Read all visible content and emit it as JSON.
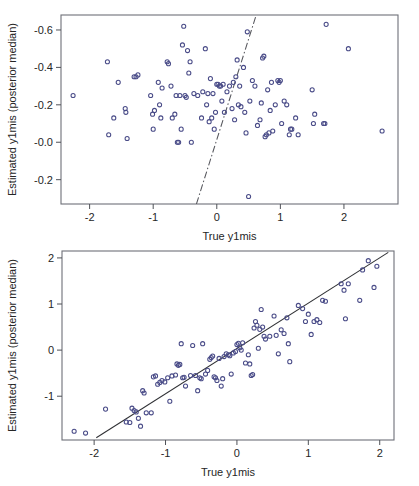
{
  "figure": {
    "panel_count": 2,
    "marker_color": "#4a4c88",
    "line_color": "#2f3034",
    "frame_color": "#6e7078",
    "background_color": "#ffffff"
  },
  "chart_data": [
    {
      "panel": "top",
      "type": "scatter",
      "title": "",
      "xlabel": "True y1mis",
      "ylabel": "Estimated y1mis (posterior median)",
      "xticks": [
        "-2",
        "-1",
        "0",
        "1",
        "2"
      ],
      "xtick_values": [
        -2,
        -1,
        0,
        1,
        2
      ],
      "yticks": [
        "-0.6",
        "-0.4",
        "-0.2",
        "-0.0",
        "-0.2"
      ],
      "ytick_values": [
        0.6,
        0.4,
        0.2,
        0.0,
        -0.2
      ],
      "xlim": [
        -2.45,
        2.85
      ],
      "ylim": [
        -0.33,
        0.68
      ],
      "grid": false,
      "legend": "none",
      "annotations": [
        "dash-dot reference line with steep positive slope"
      ],
      "reference_line": {
        "style": "dashdot",
        "x_from": -0.32,
        "y_from": -0.33,
        "x_to": 0.62,
        "y_to": 0.68
      },
      "points": [
        [
          -2.26,
          0.25
        ],
        [
          -1.72,
          0.43
        ],
        [
          -1.7,
          0.04
        ],
        [
          -1.62,
          0.13
        ],
        [
          -1.55,
          0.32
        ],
        [
          -1.44,
          0.18
        ],
        [
          -1.43,
          0.16
        ],
        [
          -1.41,
          0.02
        ],
        [
          -1.3,
          0.35
        ],
        [
          -1.27,
          0.35
        ],
        [
          -1.24,
          0.36
        ],
        [
          -1.04,
          0.25
        ],
        [
          -1.01,
          0.15
        ],
        [
          -1.0,
          0.07
        ],
        [
          -0.98,
          0.17
        ],
        [
          -0.92,
          0.32
        ],
        [
          -0.9,
          0.2
        ],
        [
          -0.88,
          0.13
        ],
        [
          -0.86,
          0.29
        ],
        [
          -0.78,
          0.43
        ],
        [
          -0.76,
          0.42
        ],
        [
          -0.72,
          0.3
        ],
        [
          -0.7,
          0.13
        ],
        [
          -0.66,
          0.15
        ],
        [
          -0.64,
          0.25
        ],
        [
          -0.62,
          0.0
        ],
        [
          -0.6,
          0.0
        ],
        [
          -0.58,
          0.25
        ],
        [
          -0.56,
          0.07
        ],
        [
          -0.54,
          0.52
        ],
        [
          -0.52,
          0.62
        ],
        [
          -0.5,
          0.25
        ],
        [
          -0.48,
          0.24
        ],
        [
          -0.46,
          0.49
        ],
        [
          -0.44,
          0.37
        ],
        [
          -0.42,
          0.43
        ],
        [
          -0.4,
          0.0
        ],
        [
          -0.36,
          0.26
        ],
        [
          -0.3,
          0.25
        ],
        [
          -0.24,
          0.13
        ],
        [
          -0.22,
          0.27
        ],
        [
          -0.18,
          0.5
        ],
        [
          -0.16,
          0.2
        ],
        [
          -0.14,
          0.26
        ],
        [
          -0.12,
          0.11
        ],
        [
          -0.1,
          0.34
        ],
        [
          -0.08,
          0.13
        ],
        [
          -0.06,
          0.26
        ],
        [
          -0.04,
          0.07
        ],
        [
          -0.02,
          0.16
        ],
        [
          0.0,
          0.31
        ],
        [
          0.02,
          0.31
        ],
        [
          0.04,
          0.3
        ],
        [
          0.06,
          0.3
        ],
        [
          0.08,
          0.22
        ],
        [
          0.1,
          0.31
        ],
        [
          0.12,
          0.16
        ],
        [
          0.16,
          0.27
        ],
        [
          0.2,
          0.3
        ],
        [
          0.24,
          0.18
        ],
        [
          0.26,
          0.32
        ],
        [
          0.28,
          0.12
        ],
        [
          0.3,
          0.35
        ],
        [
          0.32,
          0.44
        ],
        [
          0.34,
          0.2
        ],
        [
          0.36,
          0.3
        ],
        [
          0.38,
          0.19
        ],
        [
          0.42,
          0.4
        ],
        [
          0.44,
          0.16
        ],
        [
          0.46,
          0.05
        ],
        [
          0.48,
          0.59
        ],
        [
          0.5,
          -0.29
        ],
        [
          0.52,
          0.22
        ],
        [
          0.56,
          0.33
        ],
        [
          0.6,
          0.3
        ],
        [
          0.64,
          0.09
        ],
        [
          0.68,
          0.12
        ],
        [
          0.7,
          0.21
        ],
        [
          0.72,
          0.45
        ],
        [
          0.74,
          0.46
        ],
        [
          0.76,
          0.03
        ],
        [
          0.78,
          0.04
        ],
        [
          0.8,
          0.28
        ],
        [
          0.82,
          0.05
        ],
        [
          0.84,
          0.17
        ],
        [
          0.86,
          0.32
        ],
        [
          0.88,
          0.06
        ],
        [
          0.92,
          0.2
        ],
        [
          0.96,
          0.33
        ],
        [
          0.98,
          0.32
        ],
        [
          1.0,
          0.33
        ],
        [
          1.02,
          0.1
        ],
        [
          1.06,
          0.22
        ],
        [
          1.1,
          0.2
        ],
        [
          1.14,
          0.04
        ],
        [
          1.16,
          0.07
        ],
        [
          1.18,
          0.07
        ],
        [
          1.24,
          0.13
        ],
        [
          1.28,
          0.04
        ],
        [
          1.5,
          0.28
        ],
        [
          1.52,
          0.1
        ],
        [
          1.54,
          0.15
        ],
        [
          1.68,
          0.1
        ],
        [
          1.7,
          0.1
        ],
        [
          1.72,
          0.63
        ],
        [
          2.07,
          0.5
        ],
        [
          2.6,
          0.06
        ]
      ]
    },
    {
      "panel": "bottom",
      "type": "scatter",
      "title": "",
      "xlabel": "True y1mis",
      "ylabel": "Estimated y1mis (posterior median)",
      "xticks": [
        "-2",
        "-1",
        "0",
        "1",
        "2"
      ],
      "xtick_values": [
        -2,
        -1,
        0,
        1,
        2
      ],
      "yticks": [
        "2",
        "1",
        "0",
        "-1"
      ],
      "ytick_values": [
        2,
        1,
        0,
        -1
      ],
      "xlim": [
        -2.45,
        2.2
      ],
      "ylim": [
        -1.95,
        2.15
      ],
      "grid": false,
      "legend": "none",
      "annotations": [
        "solid identity reference line y = x"
      ],
      "reference_line": {
        "style": "solid",
        "x_from": -1.97,
        "y_from": -1.9,
        "x_to": 2.12,
        "y_to": 2.12
      },
      "points": [
        [
          -2.28,
          -1.76
        ],
        [
          -2.12,
          -1.8
        ],
        [
          -1.84,
          -1.28
        ],
        [
          -1.55,
          -1.56
        ],
        [
          -1.5,
          -1.57
        ],
        [
          -1.47,
          -1.26
        ],
        [
          -1.44,
          -1.31
        ],
        [
          -1.41,
          -1.34
        ],
        [
          -1.38,
          -1.48
        ],
        [
          -1.35,
          -1.65
        ],
        [
          -1.32,
          -0.88
        ],
        [
          -1.3,
          -0.93
        ],
        [
          -1.27,
          -1.36
        ],
        [
          -1.2,
          -1.36
        ],
        [
          -1.17,
          -0.58
        ],
        [
          -1.14,
          -0.56
        ],
        [
          -1.11,
          -0.74
        ],
        [
          -1.08,
          -0.7
        ],
        [
          -1.05,
          -0.66
        ],
        [
          -1.01,
          -0.69
        ],
        [
          -0.97,
          -0.6
        ],
        [
          -0.94,
          -1.11
        ],
        [
          -0.91,
          -0.56
        ],
        [
          -0.86,
          -0.54
        ],
        [
          -0.84,
          -0.3
        ],
        [
          -0.82,
          -0.33
        ],
        [
          -0.8,
          -0.31
        ],
        [
          -0.78,
          0.14
        ],
        [
          -0.76,
          -0.6
        ],
        [
          -0.74,
          -0.59
        ],
        [
          -0.72,
          -0.78
        ],
        [
          -0.65,
          -0.55
        ],
        [
          -0.62,
          0.1
        ],
        [
          -0.58,
          -0.55
        ],
        [
          -0.55,
          -0.88
        ],
        [
          -0.52,
          -0.6
        ],
        [
          -0.5,
          -0.62
        ],
        [
          -0.48,
          0.14
        ],
        [
          -0.44,
          -0.52
        ],
        [
          -0.41,
          -0.44
        ],
        [
          -0.38,
          -0.2
        ],
        [
          -0.36,
          -0.16
        ],
        [
          -0.34,
          -0.13
        ],
        [
          -0.32,
          -0.58
        ],
        [
          -0.3,
          -0.6
        ],
        [
          -0.28,
          -0.66
        ],
        [
          -0.25,
          -0.18
        ],
        [
          -0.22,
          -0.78
        ],
        [
          -0.2,
          -0.62
        ],
        [
          -0.18,
          -0.14
        ],
        [
          -0.15,
          -0.08
        ],
        [
          -0.12,
          -0.1
        ],
        [
          -0.1,
          -0.12
        ],
        [
          -0.08,
          -0.52
        ],
        [
          -0.05,
          -0.06
        ],
        [
          -0.02,
          -0.03
        ],
        [
          0.0,
          0.12
        ],
        [
          0.02,
          0.15
        ],
        [
          0.04,
          0.05
        ],
        [
          0.06,
          0.0
        ],
        [
          0.08,
          0.16
        ],
        [
          0.12,
          -0.28
        ],
        [
          0.16,
          -0.1
        ],
        [
          0.18,
          -0.3
        ],
        [
          0.2,
          -0.55
        ],
        [
          0.22,
          -0.53
        ],
        [
          0.24,
          0.48
        ],
        [
          0.26,
          0.62
        ],
        [
          0.28,
          0.54
        ],
        [
          0.3,
          0.04
        ],
        [
          0.32,
          0.45
        ],
        [
          0.34,
          0.88
        ],
        [
          0.36,
          0.5
        ],
        [
          0.38,
          0.3
        ],
        [
          0.4,
          0.24
        ],
        [
          0.46,
          0.3
        ],
        [
          0.52,
          0.74
        ],
        [
          0.55,
          0.32
        ],
        [
          0.58,
          -0.08
        ],
        [
          0.62,
          0.44
        ],
        [
          0.66,
          0.36
        ],
        [
          0.7,
          0.7
        ],
        [
          0.72,
          0.14
        ],
        [
          0.74,
          -0.25
        ],
        [
          0.86,
          0.97
        ],
        [
          0.92,
          0.9
        ],
        [
          0.96,
          0.62
        ],
        [
          1.0,
          0.78
        ],
        [
          1.04,
          0.34
        ],
        [
          1.08,
          0.62
        ],
        [
          1.12,
          0.66
        ],
        [
          1.16,
          0.6
        ],
        [
          1.2,
          1.08
        ],
        [
          1.24,
          1.06
        ],
        [
          1.46,
          1.44
        ],
        [
          1.5,
          1.3
        ],
        [
          1.52,
          0.68
        ],
        [
          1.56,
          1.44
        ],
        [
          1.72,
          1.08
        ],
        [
          1.76,
          1.74
        ],
        [
          1.84,
          1.94
        ],
        [
          1.92,
          1.36
        ],
        [
          1.96,
          1.82
        ]
      ]
    }
  ]
}
